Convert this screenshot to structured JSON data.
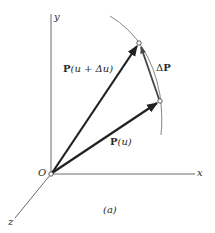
{
  "figure": {
    "caption": "(a)",
    "axes": {
      "x_label": "x",
      "y_label": "y",
      "z_label": "z",
      "origin_label": "O"
    },
    "vectors": {
      "p_u": {
        "label_bold": "P",
        "label_rest": "(u)"
      },
      "p_u_du": {
        "label_bold": "P",
        "label_rest": "(u + Δu)"
      },
      "delta_p": {
        "label_delta": "Δ",
        "label_bold": "P"
      }
    },
    "colors": {
      "axis": "#6a6a6a",
      "vector": "#222222",
      "curve": "#777777",
      "text": "#2a2a2a"
    }
  }
}
